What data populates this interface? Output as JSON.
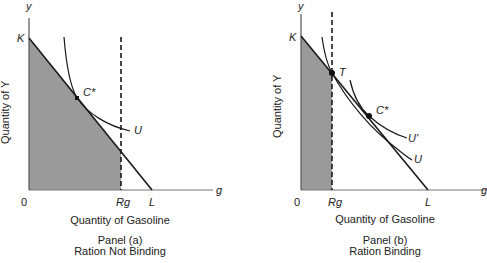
{
  "panels": [
    {
      "id": "a",
      "y_axis_symbol": "y",
      "x_axis_symbol": "g",
      "y_axis_label": "Quantity of Y",
      "x_axis_label": "Quantity of Gasoline",
      "origin_label": "0",
      "intercept_y_label": "K",
      "intercept_x_label": "L",
      "ration_label": "Rg",
      "points": [
        {
          "label": "C*"
        }
      ],
      "curves": [
        {
          "label": "U"
        }
      ],
      "panel_title": "Panel (a)",
      "panel_subtitle": "Ration Not Binding"
    },
    {
      "id": "b",
      "y_axis_symbol": "y",
      "x_axis_symbol": "g",
      "y_axis_label": "Quantity of Y",
      "x_axis_label": "Quantity of Gasoline",
      "origin_label": "0",
      "intercept_y_label": "K",
      "intercept_x_label": "L",
      "ration_label": "Rg",
      "points": [
        {
          "label": "T"
        },
        {
          "label": "C*"
        }
      ],
      "curves": [
        {
          "label": "U'"
        },
        {
          "label": "U"
        }
      ],
      "panel_title": "Panel (b)",
      "panel_subtitle": "Ration Binding"
    }
  ],
  "colors": {
    "shaded_region": "#9a9a9a",
    "line": "#1a1a1a",
    "axis": "#555555"
  }
}
